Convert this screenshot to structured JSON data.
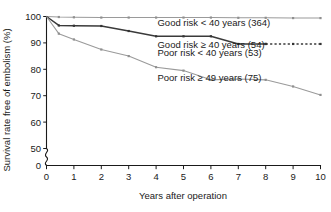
{
  "chart_data": {
    "type": "line",
    "title": "",
    "xlabel": "Years after operation",
    "ylabel": "Survival rate free of embolism (%)",
    "xlim": [
      0,
      10
    ],
    "ylim": [
      50,
      100
    ],
    "y_axis_break": true,
    "y_break_value": 0,
    "grid": false,
    "legend_position": "inline-annotations",
    "xticks": [
      "0",
      "1",
      "2",
      "3",
      "4",
      "5",
      "6",
      "7",
      "8",
      "9",
      "10"
    ],
    "yticks": [
      "0",
      "50",
      "60",
      "70",
      "80",
      "90",
      "100"
    ],
    "series": [
      {
        "name": "Good risk < 40 years (364)",
        "count": 364,
        "style": "solid",
        "color": "#9a9a9a",
        "x": [
          0,
          0.45,
          1,
          2,
          3,
          4,
          5,
          6,
          7,
          8,
          9,
          10
        ],
        "values": [
          100,
          99.8,
          99.7,
          99.6,
          99.6,
          99.6,
          99.6,
          99.6,
          99.5,
          99.5,
          99.4,
          99.4
        ]
      },
      {
        "name": "Good risk ≥ 40 years (54)",
        "count": 54,
        "style": "solid-then-dashed",
        "color": "#3a3a3a",
        "x": [
          0,
          0.45,
          1,
          2,
          3,
          4,
          5,
          6,
          7,
          8
        ],
        "values": [
          100,
          96.6,
          96.5,
          96.4,
          94.5,
          92.5,
          92.5,
          92.5,
          89.6,
          89.6
        ],
        "dashed_x": [
          8,
          9,
          10
        ],
        "dashed_values": [
          89.6,
          89.6,
          89.6
        ]
      },
      {
        "name": "Poor risk < 40 years (53)",
        "count": 53,
        "style": "solid",
        "color": "#9a9a9a",
        "note": "label shares line with Good risk ≥ 40 years annotation block"
      },
      {
        "name": "Poor risk ≥ 49 years (75)",
        "count": 75,
        "style": "solid",
        "color": "#9a9a9a",
        "x": [
          0,
          0.45,
          1,
          2,
          3,
          4,
          5,
          6,
          7,
          8,
          9,
          10
        ],
        "values": [
          100,
          93.5,
          91.3,
          87.5,
          85.0,
          80.8,
          79.5,
          76.0,
          76.3,
          76.0,
          73.5,
          70.3
        ]
      }
    ],
    "annotations": [
      {
        "text": "Good risk < 40 years (364)",
        "x": 4.05,
        "y": 96.4
      },
      {
        "text": "Good risk ≥ 40 years (54)",
        "x": 4.05,
        "y": 88.2
      },
      {
        "text": "Poor risk < 40 years (53)",
        "x": 4.05,
        "y": 85.1
      },
      {
        "text": "Poor risk ≥ 49 years (75)",
        "x": 4.05,
        "y": 75.6
      }
    ]
  },
  "colors": {
    "axis": "#1a1a1a",
    "light_series": "#9a9a9a",
    "dark_series": "#3a3a3a",
    "background": "#ffffff"
  }
}
